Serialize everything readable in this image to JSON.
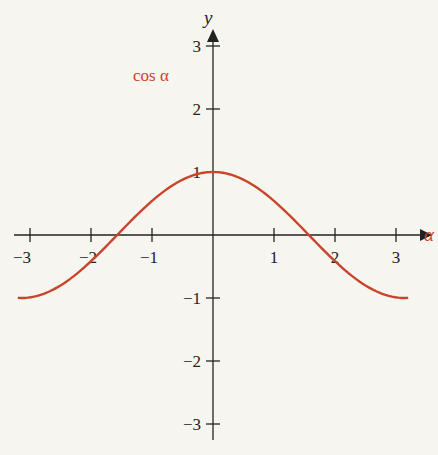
{
  "chart_data": {
    "type": "line",
    "title": "",
    "xlabel": "α",
    "ylabel": "y",
    "x_ticks": [
      "−3",
      "−2",
      "−1",
      "1",
      "2",
      "3"
    ],
    "y_ticks": [
      "3",
      "2",
      "1",
      "−1",
      "−2",
      "−3"
    ],
    "xlim": [
      -3.1,
      3.1
    ],
    "ylim": [
      -3.2,
      3.5
    ],
    "grid": false,
    "series": [
      {
        "name": "cos α",
        "color": "#c8442a",
        "function": "cos(alpha)",
        "x": [
          -3.0,
          -2.5,
          -2.0,
          -1.5,
          -1.0,
          -0.5,
          0,
          0.5,
          1.0,
          1.5,
          2.0,
          2.5,
          3.0
        ],
        "values": [
          -0.99,
          -0.8,
          -0.42,
          0.07,
          0.54,
          0.88,
          1.0,
          0.88,
          0.54,
          0.07,
          -0.42,
          -0.8,
          -0.99
        ]
      }
    ],
    "annotations": [
      {
        "text": "cos α",
        "position": "upper-left of y-axis"
      }
    ]
  },
  "labels": {
    "curve": "cos α",
    "x_axis": "α",
    "y_axis": "y",
    "xt": [
      "−3",
      "−2",
      "−1",
      "1",
      "2",
      "3"
    ],
    "yt": [
      "3",
      "2",
      "1",
      "−1",
      "−2",
      "−3"
    ]
  }
}
